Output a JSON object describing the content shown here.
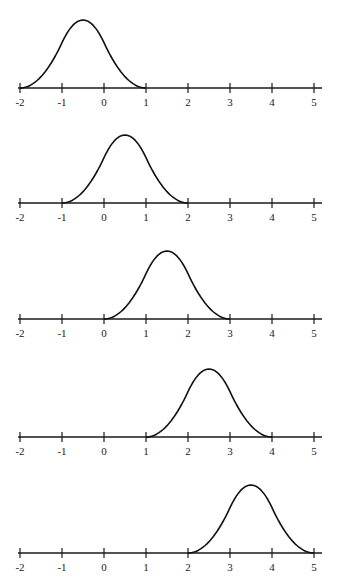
{
  "chart_data": [
    {
      "type": "line",
      "title": "",
      "xlabel": "",
      "ylabel": "",
      "xlim": [
        -2,
        5
      ],
      "x_ticks": [
        "-2",
        "-1",
        "0",
        "1",
        "2",
        "3",
        "4",
        "5"
      ],
      "grid": false,
      "series": [
        {
          "name": "basis function 1",
          "shape": "bump",
          "support": [
            -2,
            1
          ],
          "peak_x": -0.5,
          "peak_relative": 1.0
        }
      ]
    },
    {
      "type": "line",
      "title": "",
      "xlabel": "",
      "ylabel": "",
      "xlim": [
        -2,
        5
      ],
      "x_ticks": [
        "-2",
        "-1",
        "0",
        "1",
        "2",
        "3",
        "4",
        "5"
      ],
      "grid": false,
      "series": [
        {
          "name": "basis function 2",
          "shape": "bump",
          "support": [
            -1,
            2
          ],
          "peak_x": 0.5,
          "peak_relative": 1.0
        }
      ]
    },
    {
      "type": "line",
      "title": "",
      "xlabel": "",
      "ylabel": "",
      "xlim": [
        -2,
        5
      ],
      "x_ticks": [
        "-2",
        "-1",
        "0",
        "1",
        "2",
        "3",
        "4",
        "5"
      ],
      "grid": false,
      "series": [
        {
          "name": "basis function 3",
          "shape": "bump",
          "support": [
            0,
            3
          ],
          "peak_x": 1.5,
          "peak_relative": 1.0
        }
      ]
    },
    {
      "type": "line",
      "title": "",
      "xlabel": "",
      "ylabel": "",
      "xlim": [
        -2,
        5
      ],
      "x_ticks": [
        "-2",
        "-1",
        "0",
        "1",
        "2",
        "3",
        "4",
        "5"
      ],
      "grid": false,
      "series": [
        {
          "name": "basis function 4",
          "shape": "bump",
          "support": [
            1,
            4
          ],
          "peak_x": 2.5,
          "peak_relative": 1.0
        }
      ]
    },
    {
      "type": "line",
      "title": "",
      "xlabel": "",
      "ylabel": "",
      "xlim": [
        -2,
        5
      ],
      "x_ticks": [
        "-2",
        "-1",
        "0",
        "1",
        "2",
        "3",
        "4",
        "5"
      ],
      "grid": false,
      "series": [
        {
          "name": "basis function 5",
          "shape": "bump",
          "support": [
            2,
            5
          ],
          "peak_x": 3.5,
          "peak_relative": 1.0
        }
      ]
    }
  ]
}
